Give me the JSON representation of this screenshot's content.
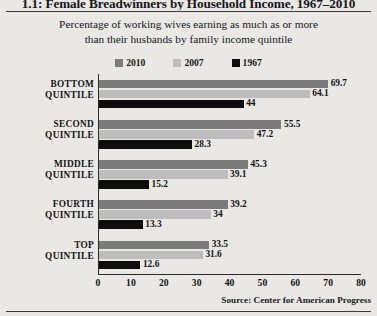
{
  "page": {
    "title": "1.1: Female Breadwinners by Household Income, 1967–2010",
    "source": "Source:  Center for American Progress"
  },
  "chart_data": {
    "type": "bar",
    "orientation": "horizontal",
    "title": "Percentage of working wives earning as much as or more than their husbands by family income quintile",
    "subtitle_line1": "Percentage of working wives earning as much as or more",
    "subtitle_line2": "than their husbands by family income quintile",
    "xlabel": "",
    "ylabel": "",
    "xlim": [
      0,
      80
    ],
    "xticks": [
      0,
      10,
      20,
      30,
      40,
      50,
      60,
      70,
      80
    ],
    "grid": false,
    "legend_position": "top-center",
    "categories": [
      "BOTTOM QUINTILE",
      "SECOND QUINTILE",
      "MIDDLE QUINTILE",
      "FOURTH QUINTILE",
      "TOP QUINTILE"
    ],
    "category_lines": [
      [
        "BOTTOM",
        "QUINTILE"
      ],
      [
        "SECOND",
        "QUINTILE"
      ],
      [
        "MIDDLE",
        "QUINTILE"
      ],
      [
        "FOURTH",
        "QUINTILE"
      ],
      [
        "TOP",
        "QUINTILE"
      ]
    ],
    "series": [
      {
        "name": "2010",
        "color": "#7b7b7b",
        "values": [
          69.7,
          55.5,
          45.3,
          39.2,
          33.5
        ],
        "labels": [
          "69.7",
          "55.5",
          "45.3",
          "39.2",
          "33.5"
        ]
      },
      {
        "name": "2007",
        "color": "#bdbdbd",
        "values": [
          64.1,
          47.2,
          39.1,
          34.0,
          31.6
        ],
        "labels": [
          "64.1",
          "47.2",
          "39.1",
          "34",
          "31.6"
        ]
      },
      {
        "name": "1967",
        "color": "#0d0d0d",
        "values": [
          44.0,
          28.3,
          15.2,
          13.3,
          12.6
        ],
        "labels": [
          "44",
          "28.3",
          "15.2",
          "13.3",
          "12.6"
        ]
      }
    ]
  }
}
